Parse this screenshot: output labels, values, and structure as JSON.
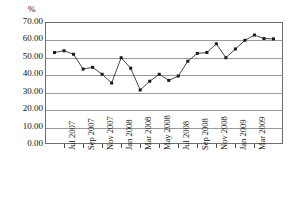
{
  "chart_data": {
    "type": "line",
    "title": "",
    "subtitle": "",
    "xlabel": "",
    "ylabel": "%",
    "ylim": [
      0,
      70
    ],
    "ytick_labels": [
      "70.00",
      "60.00",
      "50.00",
      "40.00",
      "30.00",
      "20.00",
      "10.00",
      "0.00"
    ],
    "ytick_values": [
      70,
      60,
      50,
      40,
      30,
      20,
      10,
      0
    ],
    "grid": true,
    "legend": null,
    "marker": "filled-square",
    "line_color": "#333333",
    "marker_color": "#1a1a1a",
    "grid_color": "#9a9a9a",
    "x": [
      "Jun 2007",
      "Jul 2007",
      "Aug 2007",
      "Sep 2007",
      "Oct 2007",
      "Nov 2007",
      "Dec 2007",
      "Jan 2008",
      "Feb 2008",
      "Mar 2008",
      "Apr 2008",
      "May 2008",
      "Jun 2008",
      "Jul 2008",
      "Aug 2008",
      "Sep 2008",
      "Oct 2008",
      "Nov 2008",
      "Dec 2008",
      "Jan 2009",
      "Feb 2009",
      "Mar 2009",
      "Apr 2009",
      "May 2009"
    ],
    "xtick_labels": [
      "Jul 2007",
      "Sep 2007",
      "Nov 2007",
      "Jan 2008",
      "Mar 2008",
      "May 2008",
      "Jul 2008",
      "Sep 2008",
      "Nov 2008",
      "Jan 2009",
      "Mar 2009"
    ],
    "xtick_indices": [
      1,
      3,
      5,
      7,
      9,
      11,
      13,
      15,
      17,
      19,
      21
    ],
    "values": [
      52.5,
      53.5,
      51.5,
      43.0,
      44.0,
      40.0,
      35.0,
      49.5,
      43.5,
      31.0,
      36.0,
      40.0,
      36.5,
      39.0,
      47.5,
      52.0,
      52.5,
      57.5,
      49.5,
      54.5,
      59.5,
      62.5,
      60.5,
      60.3
    ]
  }
}
